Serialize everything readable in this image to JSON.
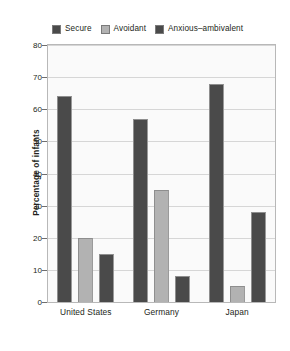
{
  "chart_data": {
    "type": "bar",
    "title": "",
    "xlabel": "",
    "ylabel": "Percentage of infants",
    "categories": [
      "United States",
      "Germany",
      "Japan"
    ],
    "series": [
      {
        "name": "Secure",
        "color": "#4a4a4a",
        "values": [
          64,
          57,
          68
        ]
      },
      {
        "name": "Avoidant",
        "color": "#b2b2b2",
        "values": [
          20,
          35,
          5
        ]
      },
      {
        "name": "Anxious–ambivalent",
        "color": "#4a4a4a",
        "values": [
          15,
          8,
          28
        ]
      }
    ],
    "ylim": [
      0,
      80
    ],
    "yticks": [
      0,
      10,
      20,
      30,
      40,
      50,
      60,
      70,
      80
    ],
    "ytick_labels": [
      "0",
      "10",
      "20",
      "30",
      "40",
      "50",
      "60",
      "70",
      "80"
    ],
    "grid": true,
    "legend_position": "top"
  },
  "legend": {
    "items": [
      {
        "label": "Secure"
      },
      {
        "label": "Avoidant"
      },
      {
        "label": "Anxious–ambivalent"
      }
    ]
  },
  "axes": {
    "y_title": "Percentage of infants"
  },
  "colors": {
    "dark_bar": "#4a4a4a",
    "light_bar": "#b2b2b2",
    "plot_background": "#fafafa",
    "plot_border": "#b8b8b8",
    "gridline": "#d6d6d6",
    "text": "#231f20",
    "page_background": "#ffffff"
  }
}
